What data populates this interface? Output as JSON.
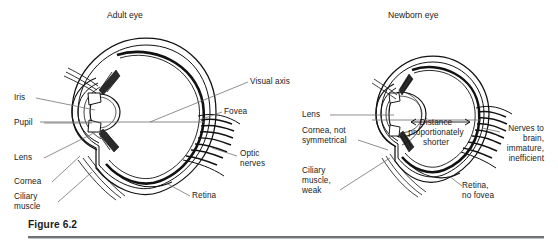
{
  "figure": {
    "caption": "Figure 6.2",
    "panels": [
      {
        "id": "adult",
        "title": "Adult eye"
      },
      {
        "id": "newborn",
        "title": "Newborn eye"
      }
    ]
  },
  "adult_eye": {
    "title": "Adult eye",
    "labels": {
      "iris": "Iris",
      "pupil": "Pupil",
      "lens": "Lens",
      "cornea": "Cornea",
      "ciliary_muscle_line1": "Ciliary",
      "ciliary_muscle_line2": "muscle",
      "visual_axis": "Visual axis",
      "fovea": "Fovea",
      "optic_nerves_line1": "Optic",
      "optic_nerves_line2": "nerves",
      "retina": "Retina"
    }
  },
  "newborn_eye": {
    "title": "Newborn eye",
    "labels": {
      "lens": "Lens",
      "cornea_line1": "Cornea, not",
      "cornea_line2": "symmetrical",
      "ciliary_line1": "Ciliary",
      "ciliary_line2": "muscle,",
      "ciliary_line3": "weak",
      "distance_line1": "Distance",
      "distance_line2": "proportionately",
      "distance_line3": "shorter",
      "nerves_line1": "Nerves to",
      "nerves_line2": "brain,",
      "nerves_line3": "immature,",
      "nerves_line4": "inefficient",
      "retina_line1": "Retina,",
      "retina_line2": "no fovea"
    }
  },
  "colors": {
    "ink": "#111111",
    "text": "#1a1a1a",
    "leader": "#6a6a6a",
    "rule": "#6f7275",
    "background": "#ffffff"
  }
}
